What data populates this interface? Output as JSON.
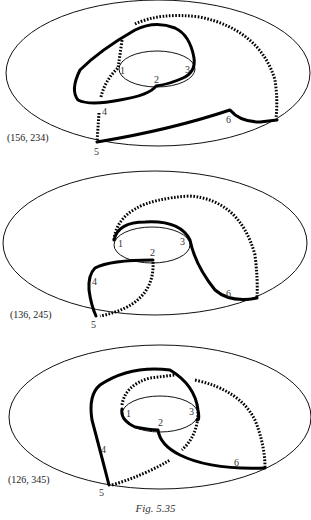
{
  "figure": {
    "caption": "Fig. 5.35",
    "panels": [
      {
        "coordinate_label": "(156, 234)",
        "vertex_labels": [
          "1",
          "2",
          "3",
          "4",
          "5",
          "6"
        ]
      },
      {
        "coordinate_label": "(136, 245)",
        "vertex_labels": [
          "1",
          "2",
          "3",
          "4",
          "5",
          "6"
        ]
      },
      {
        "coordinate_label": "(126, 345)",
        "vertex_labels": [
          "1",
          "2",
          "3",
          "4",
          "5",
          "6"
        ]
      }
    ]
  }
}
